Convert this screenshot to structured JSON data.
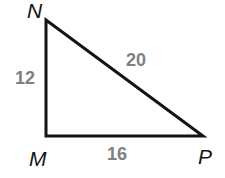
{
  "figure": {
    "kind": "right-triangle-diagram",
    "background_color": "#ffffff",
    "line_color": "#141414",
    "vertex_label_color": "#141414",
    "side_label_color": "#808080",
    "stroke_width": 3
  },
  "vertices": [
    {
      "name": "N",
      "label": "N",
      "x": 46,
      "y": 20
    },
    {
      "name": "M",
      "label": "M",
      "x": 46,
      "y": 136
    },
    {
      "name": "P",
      "label": "P",
      "x": 203,
      "y": 136
    }
  ],
  "sides": [
    {
      "name": "MN",
      "label": "12",
      "from": "M",
      "to": "N",
      "role": "leg"
    },
    {
      "name": "NP",
      "label": "20",
      "from": "N",
      "to": "P",
      "role": "hypotenuse"
    },
    {
      "name": "MP",
      "label": "16",
      "from": "M",
      "to": "P",
      "role": "leg"
    }
  ],
  "chart_data": {
    "type": "diagram",
    "title": "",
    "shape": "right triangle MNP",
    "categories": [
      "MN",
      "NP",
      "MP"
    ],
    "values": [
      12,
      20,
      16
    ],
    "point_labels": [
      "N",
      "M",
      "P"
    ],
    "points": [
      [
        46,
        20
      ],
      [
        46,
        136
      ],
      [
        203,
        136
      ]
    ],
    "edge_labels": [
      "12",
      "20",
      "16"
    ],
    "right_angle_at": "M",
    "grid": false,
    "legend": "none"
  }
}
